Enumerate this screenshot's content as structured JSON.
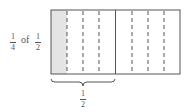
{
  "diagram": {
    "label": {
      "left_fraction": {
        "numerator": "1",
        "denominator": "4"
      },
      "connector": "of",
      "right_fraction": {
        "numerator": "1",
        "denominator": "2"
      }
    },
    "rectangle": {
      "total_parts": 8,
      "shaded_parts": 1,
      "solid_divider_after_part": 4,
      "shade_color": "#e4e4e4",
      "line_color": "#555555"
    },
    "brace_label": {
      "numerator": "1",
      "denominator": "2"
    }
  }
}
